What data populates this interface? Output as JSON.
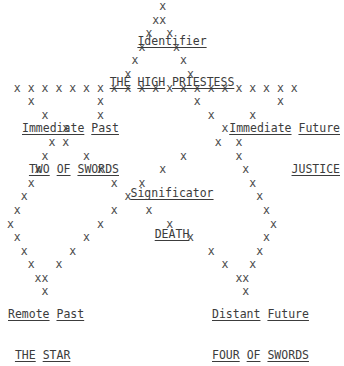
{
  "meta": {
    "background_color": "#ffffff",
    "text_color": "#4b4b4b",
    "label_color": "#3c3c3c"
  },
  "spread": {
    "identifier": {
      "role": "Identifier",
      "card": "THE HIGH PRIESTESS",
      "position": "top"
    },
    "immediate_past": {
      "role": "Immediate Past",
      "card": "TWO OF SWORDS",
      "position": "left-upper"
    },
    "immediate_future": {
      "role": "Immediate Future",
      "card": "JUSTICE",
      "position": "right-upper"
    },
    "significator": {
      "role": "Significator",
      "card": "DEATH",
      "position": "center"
    },
    "remote_past": {
      "role": "Remote Past",
      "card": "THE STAR",
      "position": "bottom-left"
    },
    "distant_future": {
      "role": "Distant Future",
      "card": "FOUR OF SWORDS",
      "position": "bottom-right"
    }
  },
  "ascii": {
    "glyph": "x",
    "art": "                       x\n                      xx\n                     x  x\n                    x    x\n                   x      x\n                  x        x\n  x x x x x x x x x x x x x x x x x x x x x\n    x         x             x           x\n      x       x               x     x\n         x                      x\n       x x                     x  x\n      x     x             x       x\n     x        x        x           x\n    x           x   x               x\n   x              x                  x\n  x             x    x                x\n x            x         x              x\n  x         x              x          x\n   x      x                   x      x\n    x   x                       x   x\n     xx                           xx\n      x                            x"
  }
}
